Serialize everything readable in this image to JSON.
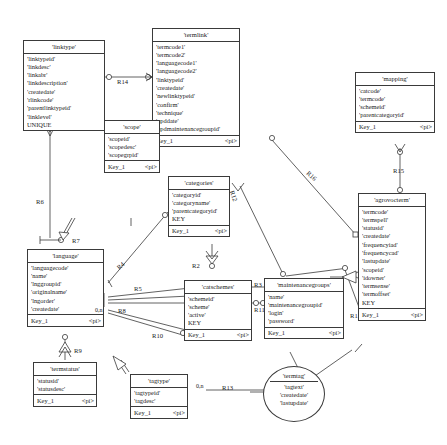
{
  "diagram": {
    "type": "entity-relationship-diagram",
    "notation": "crow's-foot / PowerDesigner CDM",
    "colors": {
      "line": "#3a3a3a",
      "text": "#1a1a1a",
      "background": "#ffffff"
    }
  },
  "entities": [
    {
      "name": "'linktype'",
      "attrs": [
        "'linktypeid'",
        "'linkdesc'",
        "'linkabr'",
        "'linkdescription'",
        "'createdate'",
        "'rlinkcode'",
        "'parentlinktypeid'",
        "'linklevel'",
        "UNIQUE"
      ],
      "key": "",
      "keytype": ""
    },
    {
      "name": "'termlink'",
      "attrs": [
        "'termcode1'",
        "'termcode2'",
        "'languagecode1'",
        "'languagecode2'",
        "'linktypeid'",
        "'createdate'",
        "'newlinktypeid'",
        "'confirm'",
        "'technique'",
        "'upddate'",
        "'updmaintenancegroupid'"
      ],
      "key": "Key_1",
      "keytype": "<pi>"
    },
    {
      "name": "'mapping'",
      "attrs": [
        "'catcode'",
        "'termcode'",
        "'schemeid'",
        "'parentcategoryid'"
      ],
      "key": "Key_1",
      "keytype": "<pi>"
    },
    {
      "name": "'scope'",
      "attrs": [
        "'scopeid'",
        "'scopedesc'",
        "'scopegrpid'"
      ],
      "key": "Key_1",
      "keytype": "<pi>"
    },
    {
      "name": "'categories'",
      "attrs": [
        "'categoryid'",
        "'categoryname'",
        "'parentcategoryid'",
        "KEY"
      ],
      "key": "Key_1",
      "keytype": "<pi>"
    },
    {
      "name": "'agrovocterm'",
      "attrs": [
        "'termcode'",
        "'termspell'",
        "'statusid'",
        "'createdate'",
        "'frequencyiad'",
        "'frequencycad'",
        "'lastupdate'",
        "'scopeid'",
        "'idowner'",
        "'termsense'",
        "'termoffset'",
        "KEY"
      ],
      "key": "Key_1",
      "keytype": "<pi>"
    },
    {
      "name": "'language'",
      "attrs": [
        "'languagecode'",
        "'name'",
        "'lnggroupid'",
        "'originalname'",
        "'lngorder'",
        "'createdate'"
      ],
      "key": "Key_1",
      "keytype": "<pi>"
    },
    {
      "name": "'catschemes'",
      "attrs": [
        "'schemeid'",
        "'scheme'",
        "'active'",
        "KEY"
      ],
      "key": "Key_1",
      "keytype": "<pi>"
    },
    {
      "name": "'maintenancegroups'",
      "attrs": [
        "'name'",
        "'maintenancegroupid'",
        "'login'",
        "'password'"
      ],
      "key": "Key_1",
      "keytype": "<pi>"
    },
    {
      "name": "'termstatus'",
      "attrs": [
        "'statusid'",
        "'statusdesc'"
      ],
      "key": "Key_1",
      "keytype": "<pi>"
    },
    {
      "name": "'tagtype'",
      "attrs": [
        "'tagtypeid'",
        "'tagdesc'"
      ],
      "key": "Key_1",
      "keytype": "<pi>"
    },
    {
      "name": "'termtag'",
      "attrs": [
        "'tagtext'",
        "'createdate'",
        "'lastupdate'"
      ],
      "key": "",
      "keytype": "",
      "shape": "ellipse"
    }
  ],
  "relationships": [
    {
      "label": "R14"
    },
    {
      "label": "R16"
    },
    {
      "label": "R15"
    },
    {
      "label": "R12"
    },
    {
      "label": "R6"
    },
    {
      "label": "R7"
    },
    {
      "label": "R4"
    },
    {
      "label": "R5"
    },
    {
      "label": "R2"
    },
    {
      "label": "R3"
    },
    {
      "label": "R11"
    },
    {
      "label": "R1"
    },
    {
      "label": "R8"
    },
    {
      "label": "R9"
    },
    {
      "label": "R10"
    },
    {
      "label": "R13"
    }
  ],
  "cardinalities": [
    {
      "label": "0,n"
    },
    {
      "label": "0,n"
    }
  ]
}
